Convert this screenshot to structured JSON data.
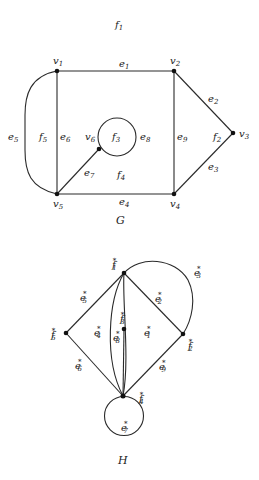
{
  "graph_G": {
    "caption": "G",
    "outer_face_label": {
      "base": "f",
      "sub": "1"
    },
    "vertices": [
      {
        "base": "v",
        "sub": "1"
      },
      {
        "base": "v",
        "sub": "2"
      },
      {
        "base": "v",
        "sub": "3"
      },
      {
        "base": "v",
        "sub": "4"
      },
      {
        "base": "v",
        "sub": "5"
      },
      {
        "base": "v",
        "sub": "6"
      }
    ],
    "edges": [
      {
        "base": "e",
        "sub": "1"
      },
      {
        "base": "e",
        "sub": "2"
      },
      {
        "base": "e",
        "sub": "3"
      },
      {
        "base": "e",
        "sub": "4"
      },
      {
        "base": "e",
        "sub": "5"
      },
      {
        "base": "e",
        "sub": "6"
      },
      {
        "base": "e",
        "sub": "7"
      },
      {
        "base": "e",
        "sub": "8"
      },
      {
        "base": "e",
        "sub": "9"
      }
    ],
    "faces": [
      {
        "base": "f",
        "sub": "2"
      },
      {
        "base": "f",
        "sub": "3"
      },
      {
        "base": "f",
        "sub": "4"
      },
      {
        "base": "f",
        "sub": "5"
      }
    ]
  },
  "graph_H": {
    "caption": "H",
    "star": "*",
    "vertices": [
      {
        "base": "f",
        "sub": "1"
      },
      {
        "base": "f",
        "sub": "2"
      },
      {
        "base": "f",
        "sub": "3"
      },
      {
        "base": "f",
        "sub": "4"
      },
      {
        "base": "f",
        "sub": "5"
      }
    ],
    "edges": [
      {
        "base": "e",
        "sub": "1"
      },
      {
        "base": "e",
        "sub": "2"
      },
      {
        "base": "e",
        "sub": "3"
      },
      {
        "base": "e",
        "sub": "4"
      },
      {
        "base": "e",
        "sub": "5"
      },
      {
        "base": "e",
        "sub": "6"
      },
      {
        "base": "e",
        "sub": "7"
      },
      {
        "base": "e",
        "sub": "8"
      },
      {
        "base": "e",
        "sub": "9"
      }
    ]
  }
}
